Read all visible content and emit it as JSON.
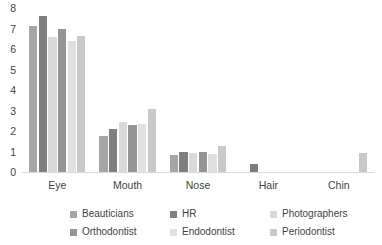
{
  "chart_data": {
    "type": "bar",
    "title": "",
    "subtitle": "",
    "xlabel": "",
    "ylabel": "",
    "ylim": [
      0,
      8
    ],
    "ytick_step": 1,
    "yticks": [
      8,
      7,
      6,
      5,
      4,
      3,
      2,
      1,
      0
    ],
    "grid": false,
    "legend_position": "bottom",
    "categories": [
      "Eye",
      "Mouth",
      "Nose",
      "Hair",
      "Chin"
    ],
    "series": [
      {
        "name": "Beauticians",
        "color": "#a6a6a6",
        "values": [
          7.1,
          1.75,
          0.85,
          0,
          0
        ]
      },
      {
        "name": "HR",
        "color": "#7f7f7f",
        "values": [
          7.6,
          2.1,
          1.0,
          0.4,
          0
        ]
      },
      {
        "name": "Photographers",
        "color": "#d9d9d9",
        "values": [
          6.6,
          2.45,
          0.95,
          0,
          0
        ]
      },
      {
        "name": "Orthodontist",
        "color": "#959595",
        "values": [
          7.0,
          2.3,
          1.0,
          0,
          0
        ]
      },
      {
        "name": "Endodontist",
        "color": "#e0e0e0",
        "values": [
          6.4,
          2.35,
          0.9,
          0,
          0
        ]
      },
      {
        "name": "Periodontist",
        "color": "#c9c9c9",
        "values": [
          6.65,
          3.05,
          1.25,
          0,
          0.95
        ]
      }
    ]
  }
}
